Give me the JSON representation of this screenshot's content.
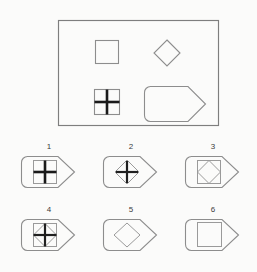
{
  "puzzle": {
    "type": "visual-analogy-matrix",
    "title": "",
    "stimulus_panel": {
      "name": "stimulus-panel",
      "frame": {
        "x": 58,
        "y": 20,
        "width": 160,
        "height": 105,
        "stroke": "#7e7e7e"
      },
      "shapes": [
        {
          "id": "plain-square",
          "shape": "square",
          "label": "square",
          "x": 95,
          "y": 40,
          "size": 23,
          "fill": "none",
          "stroke": "#8d8d8d"
        },
        {
          "id": "plain-diamond",
          "shape": "diamond",
          "label": "diamond",
          "cx": 167,
          "cy": 53,
          "size": 22,
          "fill": "none",
          "stroke": "#8d8d8d"
        },
        {
          "id": "crossed-square",
          "shape": "square-with-cross",
          "label": "square with cross",
          "x": 95,
          "y": 90,
          "size": 23,
          "fill": "none",
          "stroke": "#8d8d8d",
          "cross_stroke": "#1a1a1a"
        },
        {
          "id": "pentagon-arrow",
          "shape": "pentagon-arrow",
          "label": "rounded arrow pentagon",
          "x": 144,
          "y": 86,
          "width": 62,
          "height": 35,
          "fill": "none",
          "stroke": "#8d8d8d"
        }
      ]
    },
    "options": [
      {
        "number": "1",
        "name": "option-1",
        "contents": [
          "square",
          "cross"
        ],
        "description": "pentagon containing a square with a thick cross"
      },
      {
        "number": "2",
        "name": "option-2",
        "contents": [
          "diamond",
          "cross"
        ],
        "description": "pentagon containing a diamond with a thick cross"
      },
      {
        "number": "3",
        "name": "option-3",
        "contents": [
          "square",
          "diamond"
        ],
        "description": "pentagon containing a square with an inscribed diamond"
      },
      {
        "number": "4",
        "name": "option-4",
        "contents": [
          "square",
          "diamond",
          "cross"
        ],
        "description": "pentagon containing a square with an inscribed diamond and a thick cross"
      },
      {
        "number": "5",
        "name": "option-5",
        "contents": [
          "diamond"
        ],
        "description": "pentagon containing a diamond"
      },
      {
        "number": "6",
        "name": "option-6",
        "contents": [
          "square"
        ],
        "description": "pentagon containing a square"
      }
    ],
    "colors": {
      "background": "#fbfbfa",
      "outline_gray": "#8d8d8d",
      "frame_gray": "#7e7e7e",
      "cross_dark": "#1a1a1a",
      "label_text": "#3b3b3b"
    }
  }
}
